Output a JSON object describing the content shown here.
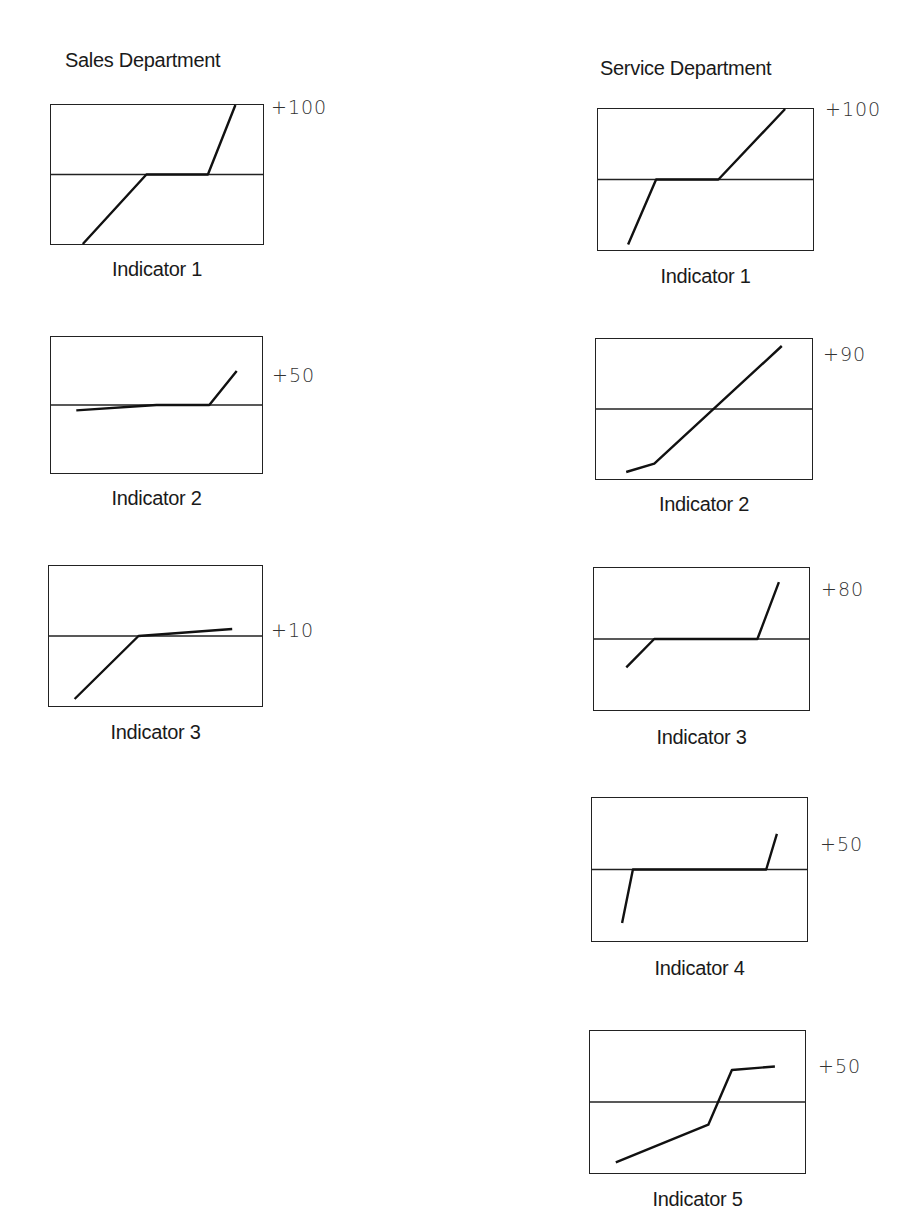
{
  "sales": {
    "title": "Sales Department",
    "indicators": [
      {
        "label": "Indicator 1",
        "max_label": "+100"
      },
      {
        "label": "Indicator 2",
        "max_label": "+50"
      },
      {
        "label": "Indicator 3",
        "max_label": "+10"
      }
    ]
  },
  "service": {
    "title": "Service Department",
    "indicators": [
      {
        "label": "Indicator 1",
        "max_label": "+100"
      },
      {
        "label": "Indicator 2",
        "max_label": "+90"
      },
      {
        "label": "Indicator 3",
        "max_label": "+80"
      },
      {
        "label": "Indicator 4",
        "max_label": "+50"
      },
      {
        "label": "Indicator 5",
        "max_label": "+50"
      }
    ]
  },
  "chart_data": [
    {
      "type": "line",
      "department": "Sales Department",
      "title": "Indicator 1",
      "max_label": "+100",
      "ylim": [
        -100,
        100
      ],
      "baseline": 0,
      "points": [
        [
          0.15,
          -100
        ],
        [
          0.45,
          0
        ],
        [
          0.74,
          0
        ],
        [
          0.87,
          100
        ]
      ]
    },
    {
      "type": "line",
      "department": "Sales Department",
      "title": "Indicator 2",
      "max_label": "+50",
      "ylim": [
        -100,
        100
      ],
      "baseline": 0,
      "points": [
        [
          0.12,
          -8
        ],
        [
          0.5,
          0
        ],
        [
          0.75,
          0
        ],
        [
          0.88,
          50
        ]
      ]
    },
    {
      "type": "line",
      "department": "Sales Department",
      "title": "Indicator 3",
      "max_label": "+10",
      "ylim": [
        -100,
        100
      ],
      "baseline": 0,
      "points": [
        [
          0.12,
          -90
        ],
        [
          0.42,
          0
        ],
        [
          0.86,
          10
        ]
      ]
    },
    {
      "type": "line",
      "department": "Service Department",
      "title": "Indicator 1",
      "max_label": "+100",
      "ylim": [
        -100,
        100
      ],
      "baseline": 0,
      "points": [
        [
          0.14,
          -92
        ],
        [
          0.27,
          0
        ],
        [
          0.56,
          0
        ],
        [
          0.87,
          100
        ]
      ]
    },
    {
      "type": "line",
      "department": "Service Department",
      "title": "Indicator 2",
      "max_label": "+90",
      "ylim": [
        -100,
        100
      ],
      "baseline": 0,
      "points": [
        [
          0.14,
          -90
        ],
        [
          0.27,
          -78
        ],
        [
          0.86,
          90
        ]
      ]
    },
    {
      "type": "line",
      "department": "Service Department",
      "title": "Indicator 3",
      "max_label": "+80",
      "ylim": [
        -100,
        100
      ],
      "baseline": 0,
      "points": [
        [
          0.15,
          -40
        ],
        [
          0.28,
          0
        ],
        [
          0.76,
          0
        ],
        [
          0.86,
          80
        ]
      ]
    },
    {
      "type": "line",
      "department": "Service Department",
      "title": "Indicator 4",
      "max_label": "+50",
      "ylim": [
        -100,
        100
      ],
      "baseline": 0,
      "points": [
        [
          0.14,
          -75
        ],
        [
          0.19,
          0
        ],
        [
          0.81,
          0
        ],
        [
          0.86,
          50
        ]
      ]
    },
    {
      "type": "line",
      "department": "Service Department",
      "title": "Indicator 5",
      "max_label": "+50",
      "ylim": [
        -100,
        100
      ],
      "baseline": 0,
      "points": [
        [
          0.12,
          -85
        ],
        [
          0.55,
          -32
        ],
        [
          0.66,
          45
        ],
        [
          0.86,
          50
        ]
      ]
    }
  ]
}
